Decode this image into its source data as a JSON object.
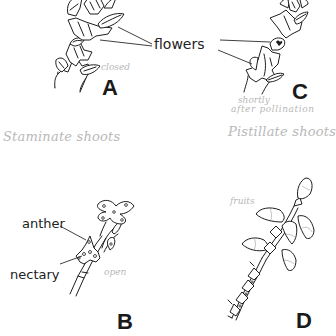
{
  "figure": {
    "type": "botanical line drawing",
    "panels": [
      {
        "id": "A",
        "letter": "A",
        "annotation": "closed",
        "description": "staminate shoot with closed flowers"
      },
      {
        "id": "B",
        "letter": "B",
        "annotation": "open",
        "description": "staminate shoot with open flowers"
      },
      {
        "id": "C",
        "letter": "C",
        "annotation_line1": "shortly",
        "annotation_line2": "after pollination",
        "description": "pistillate shoot shortly after pollination"
      },
      {
        "id": "D",
        "letter": "D",
        "annotation": "fruits",
        "description": "pistillate shoot with fruits"
      }
    ],
    "labels": {
      "flowers": "flowers",
      "anther": "anther",
      "nectary": "nectary"
    },
    "group_headings": {
      "staminate": "Staminate shoots",
      "pistillate": "Pistillate shoots"
    }
  }
}
